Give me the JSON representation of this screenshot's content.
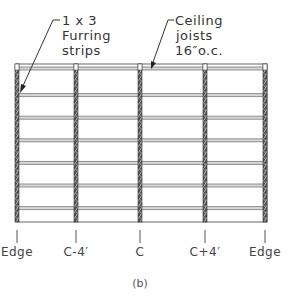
{
  "diagram": {
    "callouts": [
      {
        "id": "furring",
        "lines": [
          "1 x 3",
          "Furring",
          "strips"
        ]
      },
      {
        "id": "joists",
        "lines": [
          "Ceiling",
          "joists",
          "16″o.c."
        ]
      }
    ],
    "joist_count": 5,
    "furring_strip_count": 8,
    "position_labels": [
      "Edge",
      "C-4′",
      "C",
      "C+4′",
      "Edge"
    ],
    "caption": "(b)"
  }
}
